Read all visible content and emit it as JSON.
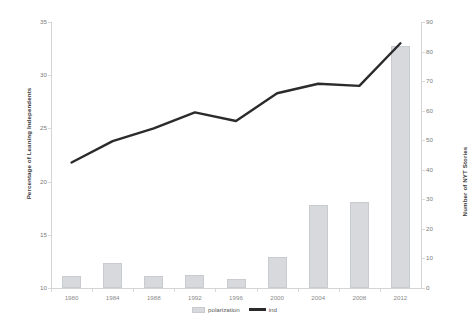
{
  "chart_data": {
    "type": "bar",
    "title": "",
    "categories": [
      "1980",
      "1984",
      "1988",
      "1992",
      "1996",
      "2000",
      "2004",
      "2008",
      "2012"
    ],
    "xlabel": "",
    "series": [
      {
        "name": "polarization",
        "type": "bar",
        "axis": "right",
        "values": [
          4,
          8.5,
          4,
          4.5,
          3,
          10.5,
          28,
          29,
          82
        ]
      },
      {
        "name": "ind",
        "type": "line",
        "axis": "left",
        "values": [
          21.8,
          23.8,
          25.0,
          26.5,
          25.7,
          28.3,
          29.2,
          29.0,
          33.0
        ]
      }
    ],
    "axes": {
      "left": {
        "label": "Percentage of Leaning Independents",
        "ticks": [
          "10",
          "15",
          "20",
          "25",
          "30",
          "35"
        ],
        "min": 10,
        "max": 35,
        "grid": false
      },
      "right": {
        "label": "Number of NYT Stories",
        "ticks": [
          "0",
          "10",
          "20",
          "30",
          "40",
          "50",
          "60",
          "70",
          "80",
          "90"
        ],
        "min": 0,
        "max": 90,
        "grid": false
      }
    },
    "legend": {
      "position": "bottom",
      "entries": [
        {
          "label": "polarization",
          "marker": "bar-swatch",
          "color": "#d7d9dd"
        },
        {
          "label": "ind",
          "marker": "line-swatch",
          "color": "#2b2b2b"
        }
      ]
    },
    "colors": {
      "bar_fill": "#d7d9dd",
      "bar_border": "#c8cbd0",
      "line": "#2b2b2b",
      "axis": "#d4d4d4",
      "tick_text": "#7d7d7d",
      "title_text": "#3a3a3a"
    }
  }
}
